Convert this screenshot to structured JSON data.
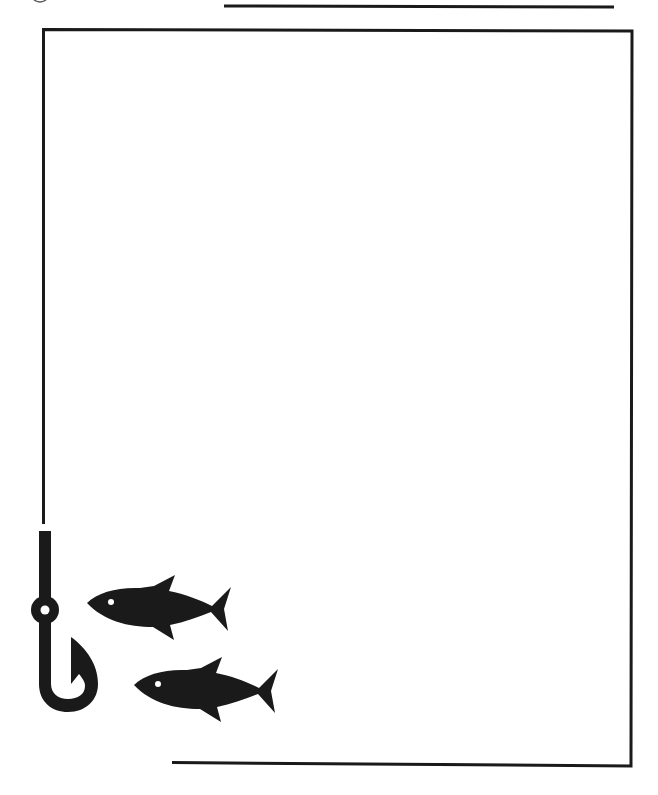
{
  "document": {
    "type": "decorative-page-border",
    "theme": "fishing",
    "background_color": "#ffffff",
    "ink_color": "#1a1a1a",
    "body_text": "",
    "title": ""
  },
  "border": {
    "top_detached_line": {
      "x1": 224,
      "y1": 6,
      "x2": 614,
      "y2": 7
    },
    "frame": {
      "top_left": [
        43,
        29
      ],
      "top_right": [
        632,
        31
      ],
      "bottom_right": [
        630,
        766
      ],
      "bottom_left_end": [
        172,
        762
      ],
      "left_line_end_y": 524
    },
    "stroke_width": 3
  },
  "ornaments": {
    "hook": {
      "label": "fishing hook",
      "icon": "fishing-hook-icon"
    },
    "fish": [
      {
        "label": "fish 1",
        "icon": "fish-icon",
        "nose": [
          87,
          603
        ],
        "offset": [
          0,
          0
        ]
      },
      {
        "label": "fish 2",
        "icon": "fish-icon",
        "nose": [
          134,
          685
        ],
        "offset": [
          47,
          82
        ]
      }
    ]
  }
}
